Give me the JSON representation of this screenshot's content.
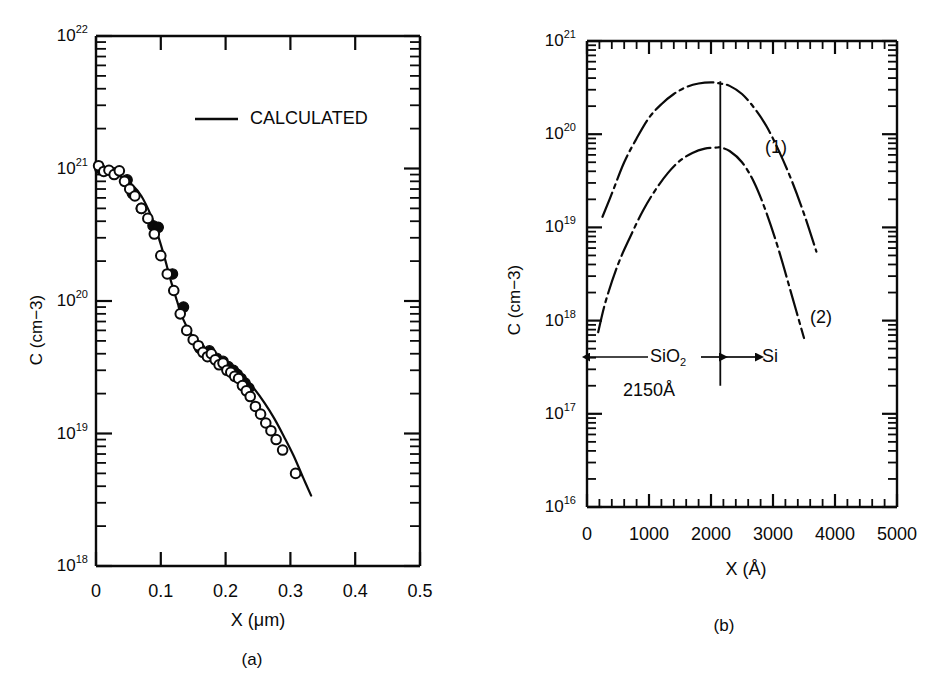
{
  "figure": {
    "background": "#ffffff",
    "ink_color": "#0a0a0a",
    "panels": [
      {
        "id": "a",
        "caption": "(a)",
        "axes": {
          "x": {
            "label_main": "X",
            "label_unit": "(μm)",
            "min": 0,
            "max": 0.5,
            "ticks": [
              {
                "value": 0,
                "label": "0"
              },
              {
                "value": 0.1,
                "label": "0.1"
              },
              {
                "value": 0.2,
                "label": "0.2"
              },
              {
                "value": 0.3,
                "label": "0.3"
              },
              {
                "value": 0.4,
                "label": "0.4"
              },
              {
                "value": 0.5,
                "label": "0.5"
              }
            ],
            "minor_step": 0.02
          },
          "y": {
            "label_main": "C",
            "label_unit": "(cm−3)",
            "scale": "log10",
            "min_exp": 18,
            "max_exp": 22,
            "ticks": [
              {
                "exp": 18,
                "mantissa": "10",
                "exponent": "18"
              },
              {
                "exp": 19,
                "mantissa": "10",
                "exponent": "19"
              },
              {
                "exp": 20,
                "mantissa": "10",
                "exponent": "20"
              },
              {
                "exp": 21,
                "mantissa": "10",
                "exponent": "21"
              },
              {
                "exp": 22,
                "mantissa": "10",
                "exponent": "22"
              }
            ]
          }
        },
        "legend": {
          "label": "CALCULATED",
          "marker": "solid-line"
        }
      },
      {
        "id": "b",
        "caption": "(b)",
        "axes": {
          "x": {
            "label_main": "X",
            "label_unit": "(Å)",
            "min": 0,
            "max": 5000,
            "ticks": [
              {
                "value": 0,
                "label": "0"
              },
              {
                "value": 1000,
                "label": "1000"
              },
              {
                "value": 2000,
                "label": "2000"
              },
              {
                "value": 3000,
                "label": "3000"
              },
              {
                "value": 4000,
                "label": "4000"
              },
              {
                "value": 5000,
                "label": "5000"
              }
            ],
            "minor_step": 200
          },
          "y": {
            "label_main": "C",
            "label_unit": "(cm−3)",
            "scale": "log10",
            "min_exp": 16,
            "max_exp": 21,
            "ticks": [
              {
                "exp": 16,
                "mantissa": "10",
                "exponent": "16"
              },
              {
                "exp": 17,
                "mantissa": "10",
                "exponent": "17"
              },
              {
                "exp": 18,
                "mantissa": "10",
                "exponent": "18"
              },
              {
                "exp": 19,
                "mantissa": "10",
                "exponent": "19"
              },
              {
                "exp": 20,
                "mantissa": "10",
                "exponent": "20"
              },
              {
                "exp": 21,
                "mantissa": "10",
                "exponent": "21"
              }
            ]
          }
        },
        "annotations": {
          "interface_x": 2150,
          "oxide_label": "SiO",
          "oxide_sub": "2",
          "silicon_label": "Si",
          "thickness_label": "2150Å",
          "curve_label_1": "(1)",
          "curve_label_2": "(2)"
        }
      }
    ]
  },
  "chart_data": [
    {
      "type": "scatter",
      "panel": "a",
      "title": "",
      "xlabel": "X (μm)",
      "ylabel": "C (cm-3)",
      "xlim": [
        0,
        0.5
      ],
      "ylim": [
        1e+18,
        1e+22
      ],
      "yscale": "log",
      "grid": false,
      "legend": [
        "CALCULATED"
      ],
      "legend_position": "upper-center",
      "series": [
        {
          "name": "open-circles-measured",
          "marker": "open-circle",
          "x": [
            0.004,
            0.012,
            0.02,
            0.028,
            0.036,
            0.044,
            0.052,
            0.06,
            0.07,
            0.08,
            0.09,
            0.1,
            0.11,
            0.12,
            0.13,
            0.14,
            0.15,
            0.158,
            0.165,
            0.172,
            0.178,
            0.184,
            0.19,
            0.196,
            0.202,
            0.208,
            0.214,
            0.22,
            0.226,
            0.232,
            0.238,
            0.246,
            0.254,
            0.262,
            0.27,
            0.278,
            0.288,
            0.308
          ],
          "y": [
            1.05e+21,
            9.5e+20,
            9.7e+20,
            9e+20,
            9.6e+20,
            8e+20,
            7e+20,
            6.2e+20,
            5e+20,
            4.2e+20,
            3.2e+20,
            2.2e+20,
            1.6e+20,
            1.2e+20,
            8e+19,
            6e+19,
            5.1e+19,
            4.6e+19,
            4.1e+19,
            3.8e+19,
            4e+19,
            3.6e+19,
            3.3e+19,
            3.4e+19,
            3e+19,
            2.9e+19,
            2.7e+19,
            2.6e+19,
            2.3e+19,
            2.1e+19,
            1.9e+19,
            1.6e+19,
            1.4e+19,
            1.2e+19,
            1.05e+19,
            9e+18,
            7.5e+18,
            5e+18
          ]
        },
        {
          "name": "filled-circles-measured",
          "marker": "filled-circle",
          "x": [
            0.006,
            0.03,
            0.048,
            0.056,
            0.07,
            0.088,
            0.096,
            0.118,
            0.135,
            0.16,
            0.175,
            0.186,
            0.196,
            0.204,
            0.212,
            0.218,
            0.224,
            0.23,
            0.236
          ],
          "y": [
            1e+21,
            9.3e+20,
            8.2e+20,
            6.5e+20,
            5e+20,
            3.7e+20,
            3.6e+20,
            1.6e+20,
            9e+19,
            4.4e+19,
            4.2e+19,
            3.7e+19,
            3.5e+19,
            3.2e+19,
            3e+19,
            2.8e+19,
            2.6e+19,
            2.4e+19,
            2.2e+19
          ]
        },
        {
          "name": "CALCULATED",
          "marker": "line",
          "style": "solid",
          "x": [
            0.0,
            0.02,
            0.04,
            0.055,
            0.07,
            0.085,
            0.095,
            0.105,
            0.115,
            0.125,
            0.135,
            0.145,
            0.155,
            0.17,
            0.185,
            0.2,
            0.215,
            0.23,
            0.245,
            0.26,
            0.275,
            0.29,
            0.305,
            0.32,
            0.332
          ],
          "y": [
            9.5e+20,
            9.3e+20,
            8.6e+20,
            7.6e+20,
            6.2e+20,
            4.4e+20,
            3.2e+20,
            2.2e+20,
            1.45e+20,
            1e+20,
            7.2e+19,
            5.8e+19,
            5e+19,
            4.3e+19,
            3.8e+19,
            3.4e+19,
            3e+19,
            2.6e+19,
            2.15e+19,
            1.7e+19,
            1.3e+19,
            9.5e+18,
            6.8e+18,
            4.6e+18,
            3.4e+18
          ]
        }
      ]
    },
    {
      "type": "line",
      "panel": "b",
      "title": "",
      "xlabel": "X (Å)",
      "ylabel": "C (cm-3)",
      "xlim": [
        0,
        5000
      ],
      "ylim": [
        1e+16,
        1e+21
      ],
      "yscale": "log",
      "grid": false,
      "series": [
        {
          "name": "(1)",
          "style": "dash-dot",
          "x": [
            250,
            400,
            600,
            800,
            1000,
            1200,
            1400,
            1600,
            1800,
            2000,
            2150,
            2300,
            2500,
            2700,
            2900,
            3100,
            3300,
            3500,
            3700
          ],
          "y": [
            1.3e+19,
            2.3e+19,
            5e+19,
            9e+19,
            1.5e+20,
            2.1e+20,
            2.7e+20,
            3.2e+20,
            3.5e+20,
            3.6e+20,
            3.5e+20,
            3.3e+20,
            2.7e+20,
            1.9e+20,
            1.2e+20,
            6.5e+19,
            3.2e+19,
            1.4e+19,
            5.5e+18
          ]
        },
        {
          "name": "(2)",
          "style": "dash-dot",
          "x": [
            180,
            300,
            500,
            700,
            900,
            1100,
            1300,
            1500,
            1700,
            1900,
            2100,
            2150,
            2300,
            2500,
            2700,
            2900,
            3100,
            3300,
            3500
          ],
          "y": [
            7.5e+17,
            1.6e+18,
            4e+18,
            8e+18,
            1.5e+19,
            2.5e+19,
            3.8e+19,
            5.2e+19,
            6.3e+19,
            7e+19,
            7.2e+19,
            7.2e+19,
            6.6e+19,
            5e+19,
            3e+19,
            1.4e+19,
            5.5e+18,
            1.9e+18,
            6.5e+17
          ]
        }
      ],
      "annotations": [
        {
          "text": "(1)",
          "x": 3300,
          "y": 9e+19
        },
        {
          "text": "(2)",
          "x": 3950,
          "y": 1.5e+18
        },
        {
          "text": "SiO2",
          "x": 900,
          "y": 5e+17
        },
        {
          "text": "Si",
          "x": 2800,
          "y": 5e+17
        },
        {
          "text": "2150A",
          "x": 750,
          "y": 2.3e+17
        },
        {
          "text": "interface-line",
          "x": 2150,
          "y": null
        }
      ]
    }
  ]
}
